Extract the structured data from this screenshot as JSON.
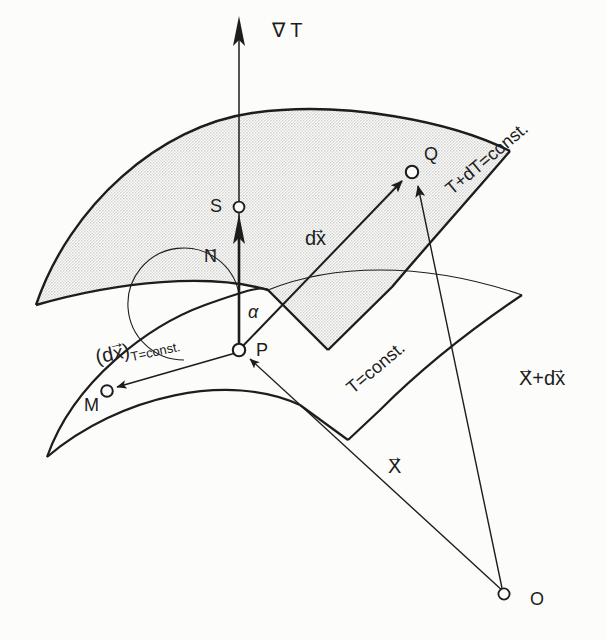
{
  "figure": {
    "kind": "vector-calculus-diagram",
    "background_color": "#fcfcfb",
    "line_color": "#1d1d1d",
    "surface_fill": "#e6e6e6"
  },
  "labels": {
    "grad_t": "∇ T",
    "point_s": "S",
    "point_p": "P",
    "point_q": "Q",
    "point_m": "M",
    "point_o": "O",
    "alpha": "α",
    "normal_n_base": "N",
    "dx_base": "dx",
    "dx_const_prefix": "(d",
    "dx_const_x": "x",
    "dx_const_suffix": ")",
    "dx_const_subscript": "T=const.",
    "iso_upper": "T+dT=const.",
    "iso_lower": "T=const.",
    "radius_x": "X",
    "radius_x_plus_dx_first": "X",
    "radius_x_plus_dx_plus": "+",
    "radius_x_plus_dx_second": "dx",
    "vector_arrow": "→"
  },
  "points": {
    "S": {
      "x": 239,
      "y": 207
    },
    "P": {
      "x": 239,
      "y": 350
    },
    "Q": {
      "x": 412,
      "y": 172
    },
    "M": {
      "x": 107,
      "y": 391
    },
    "O": {
      "x": 504,
      "y": 594
    }
  },
  "vectors": [
    {
      "name": "grad-T",
      "from": "P",
      "to_y": 20,
      "label": "∇ T"
    },
    {
      "name": "N",
      "from": "P",
      "to": "S",
      "label": "N"
    },
    {
      "name": "dx",
      "from": "P",
      "to": "Q",
      "label": "dx"
    },
    {
      "name": "dx-T-const",
      "from": "P",
      "to": "M",
      "label": "(dx)_T=const."
    },
    {
      "name": "X",
      "from": "O",
      "to": "P",
      "label": "X"
    },
    {
      "name": "X-plus-dx",
      "from": "O",
      "to": "Q",
      "label": "X+dx"
    }
  ]
}
